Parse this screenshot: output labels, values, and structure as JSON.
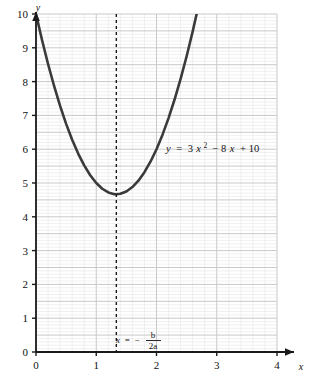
{
  "chart_data": {
    "type": "line",
    "title": "",
    "subtitle": "",
    "xlabel": "x",
    "ylabel": "y",
    "xlim": [
      0,
      4
    ],
    "ylim": [
      0,
      10
    ],
    "grid": true,
    "grid_major_x_step": 1,
    "grid_major_y_step": 0.5,
    "grid_minor_subdivisions": 5,
    "legend_position": "none",
    "xticks": [
      "0",
      "1",
      "2",
      "3",
      "4"
    ],
    "xtick_values": [
      0,
      1,
      2,
      3,
      4
    ],
    "yticks": [
      "0",
      "1",
      "2",
      "3",
      "4",
      "5",
      "6",
      "7",
      "8",
      "9",
      "10"
    ],
    "ytick_values": [
      0,
      1,
      2,
      3,
      4,
      5,
      6,
      7,
      8,
      9,
      10
    ],
    "series": [
      {
        "name": "y = 3x^2 - 8x + 10",
        "equation_a": 3,
        "equation_b": -8,
        "equation_c": 10,
        "color": "#3a3a3a",
        "x": [
          0,
          0.1,
          0.2,
          0.3,
          0.4,
          0.5,
          0.6,
          0.7,
          0.8,
          0.9,
          1.0,
          1.1,
          1.2,
          1.3,
          1.3333,
          1.4,
          1.5,
          1.6,
          1.7,
          1.8,
          1.9,
          2.0,
          2.1,
          2.2,
          2.3,
          2.4,
          2.5,
          2.6,
          2.7,
          2.7208
        ],
        "values": [
          10,
          9.23,
          8.52,
          7.87,
          7.28,
          6.75,
          6.28,
          5.87,
          5.52,
          5.23,
          5.0,
          4.83,
          4.72,
          4.67,
          4.6667,
          4.68,
          4.75,
          4.88,
          5.07,
          5.32,
          5.63,
          6.0,
          6.43,
          6.92,
          7.47,
          8.08,
          8.75,
          9.48,
          10.27,
          10.44
        ]
      }
    ],
    "annotations": [
      {
        "name": "equation-label",
        "text": "y = 3x² − 8x + 10",
        "x": 2.12,
        "y": 6.2
      },
      {
        "name": "vertex-line-label",
        "text": "x = − b / 2a",
        "x": 1.4,
        "y": 0.45
      }
    ],
    "reference_lines": [
      {
        "name": "axis-of-symmetry",
        "orientation": "vertical",
        "value": 1.3333,
        "style": "dashed",
        "label": "x = −b/(2a)"
      }
    ]
  },
  "axes": {
    "y_axis_name": "y",
    "x_axis_name": "x"
  },
  "equation": {
    "lhs": "y",
    "eq": "=",
    "term1_coef": "3",
    "term1_var": "x",
    "term1_exp": "2",
    "term2": "− 8",
    "term2_var": "x",
    "term3": "+ 10"
  },
  "vertex_label": {
    "lhs": "x",
    "eq": "=",
    "minus": "−",
    "numerator": "b",
    "denominator": "2a"
  },
  "colors": {
    "curve": "#3a3a3a",
    "axis": "#1a1a1a",
    "grid_major": "#c9c9c9",
    "grid_minor": "#e6e6e6",
    "background": "#ffffff",
    "text": "#111111"
  }
}
